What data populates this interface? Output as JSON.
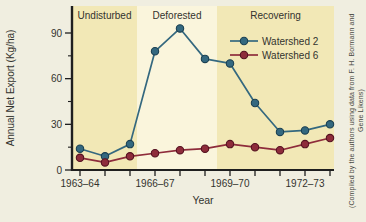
{
  "page": {
    "background": "#f0eee0",
    "caption": "(Compiled by the authors using data from F. H. Bormann and Gene Likens)"
  },
  "chart_data": {
    "type": "line",
    "title": "",
    "xlabel": "Year",
    "ylabel": "Annual Net Export (Kg/ha)",
    "categories": [
      "1963–64",
      "1964–65",
      "1965–66",
      "1966–67",
      "1967–68",
      "1968–69",
      "1969–70",
      "1970–71",
      "1971–72",
      "1972–73",
      "1973–74"
    ],
    "x_labeled_indices": [
      0,
      3,
      6,
      9
    ],
    "ylim": [
      0,
      90
    ],
    "yticks_major": [
      0,
      30,
      60,
      90
    ],
    "yticks_minor": [
      15,
      45,
      75
    ],
    "grid": false,
    "legend_position": "inside-upper-right",
    "axis_color": "#1f1f1f",
    "text_color": "#33332e",
    "series": [
      {
        "name": "Watershed 2",
        "color": "#34687f",
        "marker_edge": "#1b4052",
        "values": [
          14,
          9,
          17,
          78,
          93,
          73,
          70,
          44,
          25,
          26,
          30
        ]
      },
      {
        "name": "Watershed 6",
        "color": "#8e2c3b",
        "marker_edge": "#551221",
        "values": [
          8,
          5,
          9,
          11,
          13,
          14,
          17,
          15,
          13,
          17,
          21
        ]
      }
    ],
    "phases": [
      {
        "label": "Undisturbed",
        "from_index": -0.32,
        "to_index": 2.28,
        "fill": "#f2e8b6"
      },
      {
        "label": "Deforested",
        "from_index": 2.28,
        "to_index": 5.48,
        "fill": "#faf5dc"
      },
      {
        "label": "Recovering",
        "from_index": 5.48,
        "to_index": 10.16,
        "fill": "#f2e8b6"
      }
    ]
  }
}
